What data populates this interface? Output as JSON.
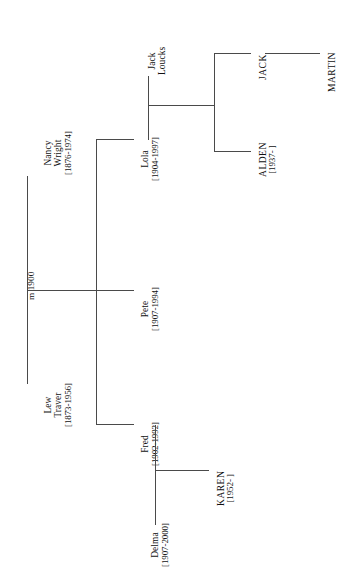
{
  "diagram": {
    "orientation": "rotated-90",
    "line_color": "#4a4a4a",
    "background": "#ffffff"
  },
  "marriage": {
    "label": "m 1900"
  },
  "people": {
    "nancy_wright": {
      "name_line1": "Nancy",
      "name_line2": "Wright",
      "dates": "[1876-1974]"
    },
    "lew_traver": {
      "name_line1": "Lew",
      "name_line2": "Traver",
      "dates": "[1873-1956]"
    },
    "jack_loucks": {
      "name_line1": "Jack",
      "name_line2": "Loucks",
      "dates": ""
    },
    "lola": {
      "name_line1": "Lola",
      "dates": "[1904-1997]"
    },
    "pete": {
      "name_line1": "Pete",
      "dates": "[1907-1994]"
    },
    "fred": {
      "name_line1": "Fred",
      "dates": "[1902-1992]"
    },
    "delma": {
      "name_line1": "Delma",
      "dates": "[1907-2000]"
    },
    "jack_child": {
      "name_line1": "JACK",
      "dates": ""
    },
    "alden": {
      "name_line1": "ALDEN",
      "dates": "[1937- ]"
    },
    "martin": {
      "name_line1": "MARTIN",
      "dates": ""
    },
    "karen": {
      "name_line1": "KAREN",
      "dates": "[1952- ]"
    }
  }
}
